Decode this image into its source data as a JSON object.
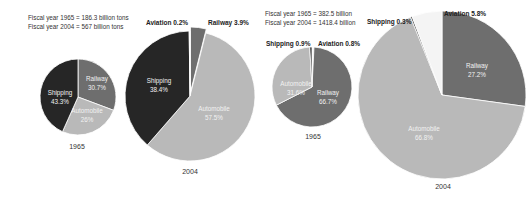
{
  "chart_data": [
    {
      "type": "pie",
      "title": "Freight transport share, 1965",
      "note": "Fiscal year 1965 = 186.3 billion tons",
      "year_label": "1965",
      "categories": [
        "Railway",
        "Automobile",
        "Shipping"
      ],
      "values": [
        30.7,
        26,
        43.3
      ],
      "labels": [
        "30.7%",
        "26%",
        "43.3%"
      ],
      "unit": "%"
    },
    {
      "type": "pie",
      "title": "Freight transport share, 2004",
      "note": "Fiscal year 2004 = 567 billion tons",
      "year_label": "2004",
      "categories": [
        "Railway",
        "Automobile",
        "Shipping",
        "Aviation"
      ],
      "values": [
        3.9,
        57.5,
        38.4,
        0.2
      ],
      "labels": [
        "3.9%",
        "57.5%",
        "38.4%",
        "0.2%"
      ],
      "unit": "%"
    },
    {
      "type": "pie",
      "title": "Passenger transport share, 1965",
      "note": "Fiscal year 1965 = 382.5 billion",
      "year_label": "1965",
      "categories": [
        "Aviation",
        "Railway",
        "Automobile",
        "Shipping"
      ],
      "values": [
        0.8,
        66.7,
        31.6,
        0.9
      ],
      "labels": [
        "0.8%",
        "66.7%",
        "31.6%",
        "0.9%"
      ],
      "unit": "%"
    },
    {
      "type": "pie",
      "title": "Passenger transport share, 2004",
      "note": "Fiscal year 2004 = 1418.4 billion",
      "year_label": "2004",
      "categories": [
        "Railway",
        "Automobile",
        "Shipping",
        "Aviation"
      ],
      "values": [
        27.2,
        66.8,
        0.3,
        5.8
      ],
      "labels": [
        "27.2%",
        "66.8%",
        "0.3%",
        "5.8%"
      ],
      "unit": "%"
    }
  ],
  "colors": {
    "Railway": "#6e6e6e",
    "Automobile": "#b9b9b9",
    "Shipping": "#262626",
    "Aviation": "#f4f4f4"
  },
  "freight": {
    "note_1965": "Fiscal year 1965 = 186.3 billion tons",
    "note_2004": "Fiscal year 2004 = 567 billion tons",
    "pie1965": {
      "railway": "Railway",
      "railway_pct": "30.7%",
      "automobile": "Automobile",
      "automobile_pct": "26%",
      "shipping": "Shipping",
      "shipping_pct": "43.3%",
      "year": "1965"
    },
    "pie2004": {
      "aviation_label": "Aviation 0.2%",
      "railway_label": "Railway 3.9%",
      "shipping": "Shipping",
      "shipping_pct": "38.4%",
      "automobile": "Automobile",
      "automobile_pct": "57.5%",
      "year": "2004"
    }
  },
  "passenger": {
    "note_1965": "Fiscal year 1965 = 382.5 billion",
    "note_2004": "Fiscal year 2004 = 1418.4 billion",
    "pie1965": {
      "shipping_label": "Shipping 0.9%",
      "aviation_label": "Aviation 0.8%",
      "automobile": "Automobile",
      "automobile_pct": "31.6%",
      "railway": "Railway",
      "railway_pct": "66.7%",
      "year": "1965"
    },
    "pie2004": {
      "shipping_label": "Shipping 0.3%",
      "aviation_label": "Aviation 5.8%",
      "railway": "Railway",
      "railway_pct": "27.2%",
      "automobile": "Automobile",
      "automobile_pct": "66.8%",
      "year": "2004"
    }
  }
}
